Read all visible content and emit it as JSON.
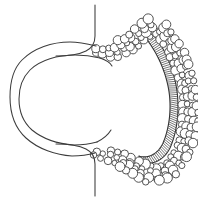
{
  "figure": {
    "title": "Histological cross-section line drawing",
    "width": 198,
    "height": 201,
    "background_color": "#ffffff",
    "line_color": "#3c3c3c",
    "cell_stroke_color": "#4a4a4a",
    "band_stroke_color": "#333333",
    "caption": ""
  },
  "chart_data": {
    "type": "diagram",
    "title": "Histological cross-section line drawing",
    "parts": [
      {
        "name": "outer-wall-contour",
        "label": "Outer wall contour",
        "style": "smooth single line"
      },
      {
        "name": "inner-wall-contour",
        "label": "Inner wall contour",
        "style": "smooth single line, parallel to outer"
      },
      {
        "name": "upper-neck-line",
        "label": "Upper neck line",
        "style": "vertical line curving left"
      },
      {
        "name": "lower-neck-line",
        "label": "Lower neck line",
        "style": "vertical line curving left"
      },
      {
        "name": "cell-cluster",
        "label": "Circular cell cluster",
        "style": "open circles, varied radii",
        "count": 168,
        "radius_range_px": [
          2.0,
          5.2
        ]
      },
      {
        "name": "hatched-band",
        "label": "Hatched striated band",
        "style": "crescent band with transverse rungs",
        "rung_count": 72
      }
    ],
    "axis_ranges": {
      "x": [
        0,
        198
      ],
      "y": [
        0,
        201
      ]
    },
    "grid": false,
    "legend": "none"
  },
  "geometry": {
    "outer_wall_path": "M 96,46 C 88,44 80,42 70,42 C 52,42 34,48 22,60 C 13,69 10,83 10,97 C 10,113 15,128 26,138 C 38,149 56,155 72,156 C 80,156 88,155 95,153",
    "inner_wall_path": "M 100,58 C 92,56 84,55 75,55 C 58,55 40,60 30,70 C 22,78 19,88 19,99 C 19,111 23,122 32,130 C 43,139 59,144 74,145 C 82,145 90,144 97,142",
    "inner_bulb_upper_path": "M 100,58 C 106,60 110,62 112,66",
    "inner_bulb_lower_path": "M 97,142 C 103,139 108,135 111,130",
    "upper_neck_path": "M 95,5 L 95,36 C 95,44 92,48 86,51 C 78,55 66,56 56,56",
    "lower_neck_path": "M 95,196 L 95,164 C 95,156 92,152 86,149 C 78,145 66,144 56,144",
    "band_outer_path": "M 150,30 C 162,44 172,64 176,85 C 180,106 178,130 170,148 C 164,160 152,166 142,162",
    "band_inner_path": "M 144,36 C 155,49 164,67 168,86 C 172,105 170,127 163,143 C 158,154 148,159 139,156",
    "cluster_spine_path": "M 92,52 C 104,56 118,55 130,46 C 140,38 148,31 156,28 C 168,40 180,62 185,86 C 190,110 187,136 178,154 C 170,170 156,176 146,170 C 136,164 126,158 114,156 C 104,154 96,152 92,150"
  },
  "metadata": {
    "domain": "diagram",
    "rendering": "line art, monochrome"
  }
}
